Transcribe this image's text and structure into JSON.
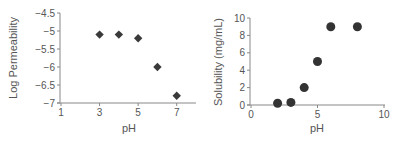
{
  "chart_data": [
    {
      "type": "scatter",
      "title": "",
      "xlabel": "pH",
      "ylabel": "Log Permeability",
      "xlim": [
        1,
        8
      ],
      "ylim": [
        -7,
        -4.5
      ],
      "x_ticks": [
        1,
        3,
        5,
        7
      ],
      "x_tick_labels": [
        "1",
        "3",
        "5",
        "7"
      ],
      "y_ticks": [
        -4.5,
        -5,
        -5.5,
        -6,
        -6.5,
        -7
      ],
      "y_tick_labels": [
        "−4.5",
        "−5",
        "−5.5",
        "−6",
        "−6.5",
        "−7"
      ],
      "grid": false,
      "legend": null,
      "marker": "diamond",
      "marker_color": "#3a3a3a",
      "series": [
        {
          "name": "Log Permeability",
          "x": [
            3,
            4,
            5,
            6,
            7
          ],
          "y": [
            -5.1,
            -5.1,
            -5.2,
            -6.0,
            -6.8
          ]
        }
      ]
    },
    {
      "type": "scatter",
      "title": "",
      "xlabel": "pH",
      "ylabel": "Solubility (mg/mL)",
      "xlim": [
        0,
        10
      ],
      "ylim": [
        0,
        10
      ],
      "x_ticks": [
        0,
        5,
        10
      ],
      "x_tick_labels": [
        "0",
        "5",
        "10"
      ],
      "y_ticks": [
        0,
        2,
        4,
        6,
        8,
        10
      ],
      "y_tick_labels": [
        "0",
        "2",
        "4",
        "6",
        "8",
        "10"
      ],
      "grid": false,
      "legend": null,
      "marker": "circle",
      "marker_color": "#333333",
      "series": [
        {
          "name": "Solubility",
          "x": [
            2,
            3,
            4,
            5,
            6,
            8
          ],
          "y": [
            0.2,
            0.3,
            2,
            5,
            9,
            9
          ]
        }
      ]
    }
  ]
}
